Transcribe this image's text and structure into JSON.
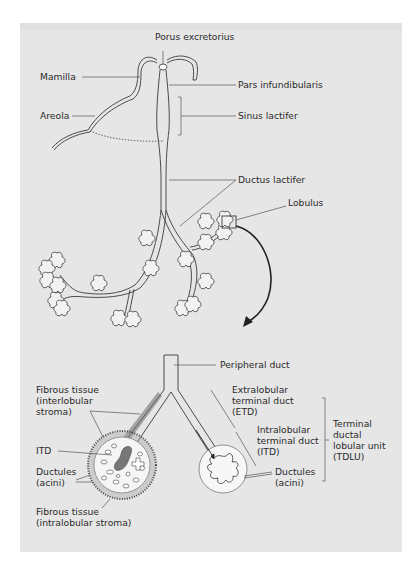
{
  "diagram": {
    "top_section": {
      "labels": {
        "porus": "Porus excretorius",
        "mamilla": "Mamilla",
        "pars": "Pars infundibularis",
        "areola": "Areola",
        "sinus": "Sinus lactifer",
        "ductus": "Ductus lactifer",
        "lobulus": "Lobulus"
      }
    },
    "bottom_section": {
      "labels": {
        "peripheral_duct": "Peripheral duct",
        "fibrous_inter": "Fibrous tissue\n(interlobular\nstroma)",
        "itd_left": "ITD",
        "ductules_left": "Ductules\n(acini)",
        "fibrous_intra": "Fibrous tissue\n(intralobular stroma)",
        "etd": "Extralobular\nterminal duct\n(ETD)",
        "itd_right": "Intralobular\nterminal duct\n(ITD)",
        "ductules_right": "Ductules\n(acini)",
        "tdlu": "Terminal\nductal\nlobular unit\n(TDLU)"
      }
    },
    "colors": {
      "panel": "#e6e6e6",
      "line": "#3a3a3a",
      "leader": "#555555",
      "lobule_fill": "#f7f7f7",
      "itd_fill": "#777777"
    }
  }
}
